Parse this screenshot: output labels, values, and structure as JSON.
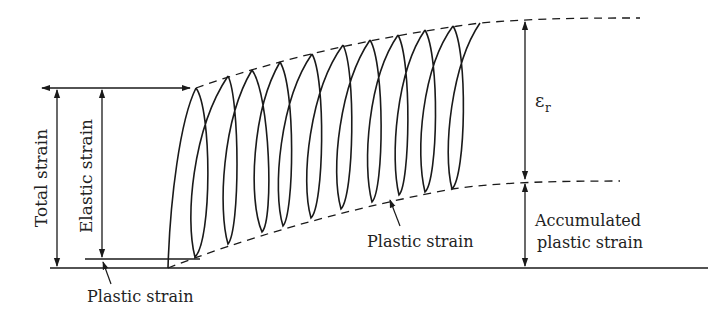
{
  "diagram": {
    "type": "cyclic-loading strain accumulation (ratcheting) diagram",
    "colors": {
      "line": "#1a1a1a",
      "text": "#222222",
      "background": "#ffffff"
    },
    "labels": {
      "total_strain": "Total strain",
      "elastic_strain": "Elastic strain",
      "plastic_strain_first": "Plastic strain",
      "plastic_strain_cycle": "Plastic strain",
      "epsilon_r_symbol": "ε",
      "epsilon_r_subscript": "r",
      "accumulated_line1": "Accumulated",
      "accumulated_line2": "plastic strain"
    },
    "loops": {
      "count": 10,
      "tops": [
        [
          196,
          88
        ],
        [
          228,
          76
        ],
        [
          252,
          70
        ],
        [
          280,
          62
        ],
        [
          312,
          54
        ],
        [
          343,
          45
        ],
        [
          370,
          40
        ],
        [
          398,
          35
        ],
        [
          425,
          30
        ],
        [
          453,
          26
        ]
      ],
      "bottoms": [
        [
          195,
          257
        ],
        [
          228,
          244
        ],
        [
          262,
          232
        ],
        [
          283,
          226
        ],
        [
          311,
          218
        ],
        [
          341,
          209
        ],
        [
          372,
          202
        ],
        [
          399,
          195
        ],
        [
          425,
          192
        ],
        [
          452,
          189
        ]
      ],
      "end_point": [
        480,
        23
      ]
    },
    "envelopes": {
      "upper_dashed": "from first loop peak rising to the right, leveling off",
      "lower_dashed": "from baseline rising through loop bottoms, leveling off"
    }
  }
}
